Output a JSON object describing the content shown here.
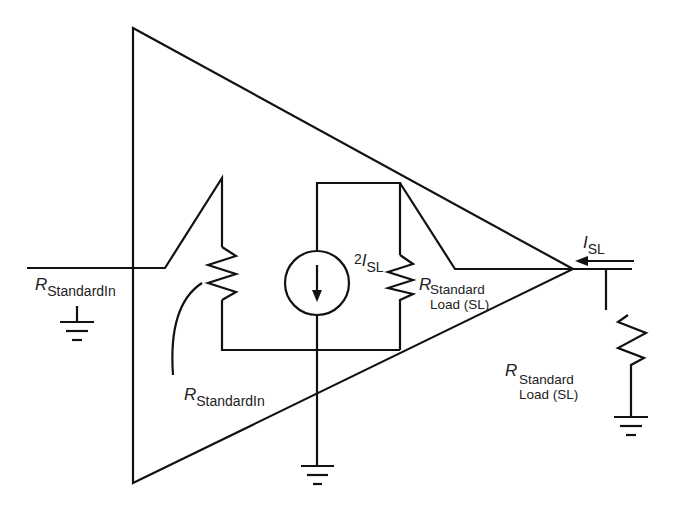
{
  "diagram": {
    "title": "",
    "colors": {
      "stroke": "#111111",
      "text": "#222222",
      "background": "#ffffff"
    },
    "labels": {
      "input_resistor_left": {
        "symbol": "R",
        "subscript": "StandardIn"
      },
      "input_resistor_inner": {
        "symbol": "R",
        "subscript": "StandardIn"
      },
      "current_source": {
        "prefix": "2",
        "symbol": "I",
        "subscript": "SL"
      },
      "load_resistor_inner": {
        "symbol": "R",
        "subscript_line1": "Standard",
        "subscript_line2": "Load (SL)"
      },
      "output_current": {
        "symbol": "I",
        "subscript": "SL"
      },
      "load_resistor_external": {
        "symbol": "R",
        "subscript_line1": "Standard",
        "subscript_line2": "Load (SL)"
      }
    },
    "components": [
      {
        "id": "amplifier-triangle",
        "type": "amplifier"
      },
      {
        "id": "input-resistor",
        "type": "resistor",
        "label": "R StandardIn"
      },
      {
        "id": "current-source",
        "type": "current-source",
        "label": "2 I SL",
        "direction": "down"
      },
      {
        "id": "inner-load-resistor",
        "type": "resistor",
        "label": "R Standard Load (SL)"
      },
      {
        "id": "external-load-resistor",
        "type": "resistor",
        "label": "R Standard Load (SL)"
      },
      {
        "id": "ground-input",
        "type": "ground"
      },
      {
        "id": "ground-center",
        "type": "ground"
      },
      {
        "id": "ground-output",
        "type": "ground"
      },
      {
        "id": "output-current-arrow",
        "type": "arrow",
        "label": "I SL",
        "direction": "left"
      }
    ]
  }
}
